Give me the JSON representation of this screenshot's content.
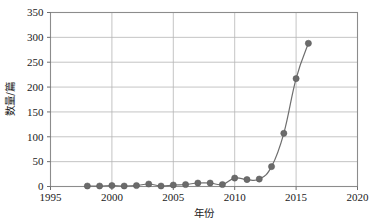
{
  "chart_data": {
    "type": "line",
    "title": "",
    "subtitle": "",
    "xlabel": "年份",
    "ylabel": "数量/篇",
    "xlim": [
      1995,
      2020
    ],
    "ylim": [
      0,
      350
    ],
    "xticks": [
      1995,
      2000,
      2005,
      2010,
      2015,
      2020
    ],
    "yticks": [
      0,
      50,
      100,
      150,
      200,
      250,
      300,
      350
    ],
    "xtick_labels": [
      "1995",
      "2000",
      "2005",
      "2010",
      "2015",
      "2020"
    ],
    "ytick_labels": [
      "0",
      "50",
      "100",
      "150",
      "200",
      "250",
      "300",
      "350"
    ],
    "grid": "horizontal-and-vertical",
    "legend": "none",
    "marker": "circle",
    "series_color": "#6b6b6b",
    "x": [
      1998,
      1999,
      2000,
      2001,
      2002,
      2003,
      2004,
      2005,
      2006,
      2007,
      2008,
      2009,
      2010,
      2011,
      2012,
      2013,
      2014,
      2015,
      2016
    ],
    "values": [
      1,
      1,
      2,
      1,
      2,
      5,
      1,
      3,
      4,
      7,
      7,
      4,
      17,
      14,
      15,
      40,
      107,
      217,
      288
    ],
    "series": [
      {
        "name": "数量/篇",
        "values": [
          1,
          1,
          2,
          1,
          2,
          5,
          1,
          3,
          4,
          7,
          7,
          4,
          17,
          14,
          15,
          40,
          107,
          217,
          288
        ]
      }
    ]
  },
  "colors": {
    "background": "#ffffff",
    "grid": "#b5b5b5",
    "frame": "#8c8c8c",
    "series": "#6b6b6b",
    "text": "#1a1a1a"
  }
}
